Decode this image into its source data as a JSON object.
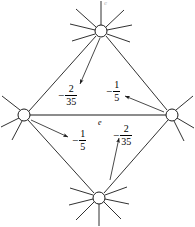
{
  "figure": {
    "type": "graph-diagram",
    "stroke_color": "#1a1a1a",
    "node_fill": "#ffffff",
    "top_mark": "e"
  },
  "nodes": [
    {
      "id": "top",
      "name": "vertex-top",
      "cx": 101,
      "cy": 31,
      "r": 6
    },
    {
      "id": "left",
      "name": "vertex-left",
      "cx": 24,
      "cy": 115,
      "r": 6
    },
    {
      "id": "right",
      "name": "vertex-right",
      "cx": 172,
      "cy": 115,
      "r": 6
    },
    {
      "id": "bottom",
      "name": "vertex-bottom",
      "cx": 99,
      "cy": 198,
      "r": 6
    }
  ],
  "edges": [
    {
      "name": "edge-top-left",
      "from": "top",
      "to": "left"
    },
    {
      "name": "edge-top-right",
      "from": "top",
      "to": "right"
    },
    {
      "name": "edge-left-right",
      "from": "left",
      "to": "right",
      "label": "e"
    },
    {
      "name": "edge-left-bottom",
      "from": "left",
      "to": "bottom"
    },
    {
      "name": "edge-right-bottom",
      "from": "right",
      "to": "bottom"
    }
  ],
  "labels": {
    "upper_left": {
      "sign": "−",
      "numerator": "2",
      "denominator": "35",
      "text": "-2/35"
    },
    "upper_right": {
      "sign": "−",
      "numerator": "1",
      "denominator": "5",
      "text": "-1/5"
    },
    "lower_left": {
      "sign": "−",
      "numerator": "1",
      "denominator": "5",
      "text": "-1/5"
    },
    "lower_right": {
      "sign": "−",
      "numerator": "2",
      "denominator": "35",
      "text": "-2/35"
    },
    "center_edge": {
      "text": "e"
    }
  },
  "arrows": [
    {
      "name": "arrow-to-upper-left-label",
      "from_node": "top",
      "points_to": "upper_left",
      "direction": "down-left"
    },
    {
      "name": "arrow-to-upper-right-label",
      "from_node": "right",
      "points_to": "upper_right",
      "direction": "up-left"
    },
    {
      "name": "arrow-to-lower-left-label",
      "from_node": "left",
      "points_to": "lower_left",
      "direction": "down-right"
    },
    {
      "name": "arrow-to-lower-right-label",
      "from_node": "bottom",
      "points_to": "lower_right",
      "direction": "up"
    }
  ]
}
